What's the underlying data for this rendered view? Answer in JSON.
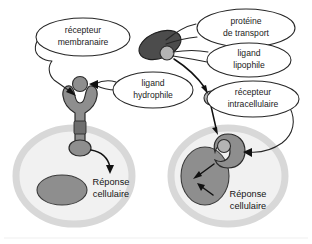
{
  "figure": {
    "language": "fr"
  },
  "callouts": [
    {
      "id": "recepteur-membranaire",
      "line1": "récepteur",
      "line2": "membranaire"
    },
    {
      "id": "proteine-de-transport",
      "line1": "protéine",
      "line2": "de transport"
    },
    {
      "id": "ligand-lipophile",
      "line1": "ligand",
      "line2": "lipophile"
    },
    {
      "id": "ligand-hydrophile",
      "line1": "ligand",
      "line2": "hydrophile"
    },
    {
      "id": "recepteur-intracellulaire",
      "line1": "récepteur",
      "line2": "intracellulaire"
    }
  ],
  "responses": [
    {
      "id": "reponse-cellulaire-gauche",
      "line1": "Réponse",
      "line2": "cellulaire"
    },
    {
      "id": "reponse-cellulaire-droite",
      "line1": "Réponse",
      "line2": "cellulaire"
    }
  ],
  "colors": {
    "background": "#ffffff",
    "text": "#1b1b1b",
    "outline": "#262626",
    "cell_membrane": "#d8d8d8",
    "cytoplasm": "#f1f1f1",
    "nucleus": "#8e8e8e",
    "transport_protein": "#4c4c4c",
    "ligand_lipophile": "#b4b4b4",
    "ligand_hydrophile": "#6e6e6e",
    "receptor": "#8e8e8e",
    "arrow": "#111111"
  },
  "diagram": {
    "left_panel_label": "Voie du ligand hydrophile",
    "right_panel_label": "Voie du ligand lipophile"
  }
}
